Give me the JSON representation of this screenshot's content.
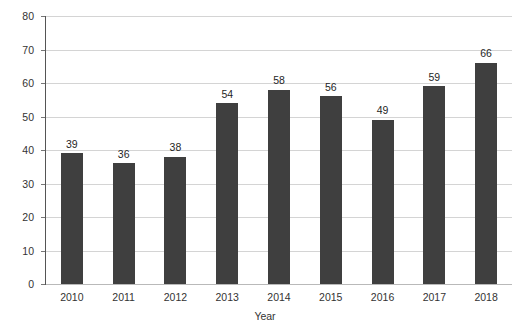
{
  "chart_data": {
    "type": "bar",
    "title": "",
    "subtitle": "",
    "categories": [
      "2010",
      "2011",
      "2012",
      "2013",
      "2014",
      "2015",
      "2016",
      "2017",
      "2018"
    ],
    "values": [
      39,
      36,
      38,
      54,
      58,
      56,
      49,
      59,
      66
    ],
    "data_labels": [
      "39",
      "36",
      "38",
      "54",
      "58",
      "56",
      "49",
      "59",
      "66"
    ],
    "xlabel": "Year",
    "ylabel": "Number",
    "ylim": [
      0,
      80
    ],
    "yticks": [
      0,
      10,
      20,
      30,
      40,
      50,
      60,
      70,
      80
    ],
    "ytick_labels": [
      "0",
      "10",
      "20",
      "30",
      "40",
      "50",
      "60",
      "70",
      "80"
    ],
    "grid": true,
    "grid_axis": "y",
    "legend": false,
    "legend_position": "none",
    "series": [
      {
        "name": "Number",
        "values": [
          39,
          36,
          38,
          54,
          58,
          56,
          49,
          59,
          66
        ]
      }
    ],
    "colors": {
      "bar": "#3f3f3f",
      "gridline": "#d4d4d4",
      "axis": "#555555",
      "text": "#333333",
      "background": "#ffffff"
    }
  }
}
